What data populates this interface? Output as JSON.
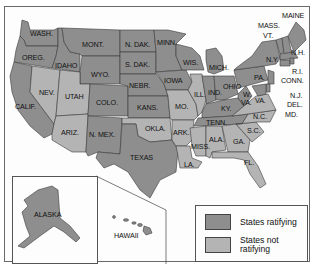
{
  "map": {
    "subject": "Ratification status by state",
    "legend": {
      "items": [
        {
          "label": "States ratifying",
          "color": "#8e8e8e"
        },
        {
          "label": "States not ratifying",
          "label_line1": "States not",
          "label_line2": "ratifying",
          "color": "#b4b4b4"
        }
      ]
    },
    "colors": {
      "ratifying": "#8e8e8e",
      "not_ratifying": "#b4b4b4",
      "border": "#3a3a3a"
    },
    "labels": {
      "wash": "WASH.",
      "oreg": "OREG.",
      "calif": "CALIF.",
      "idaho": "IDAHO",
      "nev": "NEV.",
      "mont": "MONT.",
      "wyo": "WYO.",
      "utah": "UTAH",
      "ariz": "ARIZ.",
      "colo": "COLO.",
      "nmex": "N. MEX.",
      "ndak": "N. DAK.",
      "sdak": "S. DAK.",
      "nebr": "NEBR.",
      "kans": "KANS.",
      "okla": "OKLA.",
      "texas": "TEXAS",
      "minn": "MINN.",
      "iowa": "IOWA",
      "mo": "MO.",
      "ark": "ARK.",
      "la": "LA.",
      "wis": "WIS.",
      "ill": "ILL.",
      "mich": "MICH.",
      "ind": "IND.",
      "ohio": "OHIO",
      "ky": "KY.",
      "tenn": "TENN.",
      "miss": "MISS.",
      "ala": "ALA.",
      "ga": "GA.",
      "fla": "FL.",
      "sc": "S.C.",
      "nc": "N.C.",
      "va": "VA.",
      "wva1": "W.",
      "wva2": "VA.",
      "pa": "PA.",
      "ny": "N.Y.",
      "vt": "VT.",
      "mass": "MASS.",
      "maine": "MAINE",
      "nh": "N.H.",
      "ri": "R.I.",
      "conn": "CONN.",
      "nj": "N.J.",
      "del": "DEL.",
      "md": "MD.",
      "alaska": "ALASKA",
      "hawaii": "HAWAII"
    },
    "states_ratifying": [
      "WASH.",
      "OREG.",
      "CALIF.",
      "IDAHO",
      "MONT.",
      "WYO.",
      "COLO.",
      "N. MEX.",
      "N. DAK.",
      "S. DAK.",
      "NEBR.",
      "KANS.",
      "TEXAS",
      "MINN.",
      "IOWA",
      "WIS.",
      "MICH.",
      "IND.",
      "OHIO",
      "KY.",
      "TENN.",
      "W. VA.",
      "PA.",
      "N.Y.",
      "VT.",
      "MASS.",
      "MAINE",
      "N.H.",
      "R.I.",
      "CONN.",
      "N.J.",
      "DEL.",
      "MD.",
      "ALASKA",
      "HAWAII"
    ],
    "states_not_ratifying": [
      "NEV.",
      "UTAH",
      "ARIZ.",
      "OKLA.",
      "MO.",
      "ARK.",
      "LA.",
      "ILL.",
      "MISS.",
      "ALA.",
      "GA.",
      "FL.",
      "S.C.",
      "N.C.",
      "VA."
    ]
  }
}
